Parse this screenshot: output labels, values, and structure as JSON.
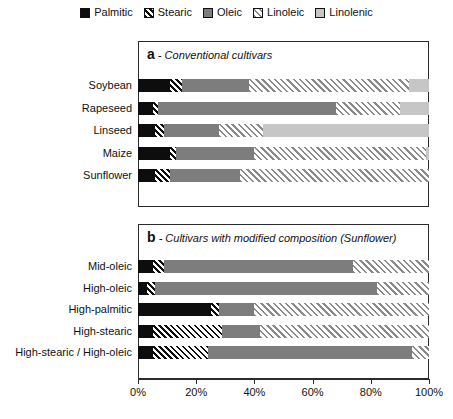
{
  "legend": {
    "position": "top-center",
    "items": [
      {
        "label": "Palmitic",
        "key": "palmitic",
        "fill": "#0d0d0d",
        "pattern": "solid-black"
      },
      {
        "label": "Stearic",
        "key": "stearic",
        "fill": "#ffffff",
        "pattern": "diagonal-hatch-dark"
      },
      {
        "label": "Oleic",
        "key": "oleic",
        "fill": "#7d7d7d",
        "pattern": "solid-gray"
      },
      {
        "label": "Linoleic",
        "key": "linoleic",
        "fill": "#ffffff",
        "pattern": "diagonal-hatch-gray"
      },
      {
        "label": "Linolenic",
        "key": "linolenic",
        "fill": "#c6c6c6",
        "pattern": "solid-light-gray"
      }
    ]
  },
  "chart_data": {
    "type": "bar",
    "orientation": "horizontal",
    "stacked": true,
    "title": "",
    "xlabel": "",
    "ylabel": "",
    "xlim": [
      0,
      100
    ],
    "xticks": [
      "0%",
      "20%",
      "40%",
      "60%",
      "80%",
      "100%"
    ],
    "xtick_values": [
      0,
      20,
      40,
      60,
      80,
      100
    ],
    "grid": false,
    "legend_entries": [
      "Palmitic",
      "Stearic",
      "Oleic",
      "Linoleic",
      "Linolenic"
    ],
    "panels": [
      {
        "id": "a",
        "marker": "a",
        "title": "- Conventional cultivars",
        "categories": [
          "Soybean",
          "Rapeseed",
          "Linseed",
          "Maize",
          "Sunflower"
        ],
        "series": [
          {
            "name": "Palmitic",
            "values": [
              11,
              5,
              6,
              11,
              6
            ]
          },
          {
            "name": "Stearic",
            "values": [
              4,
              2,
              3,
              2,
              5
            ]
          },
          {
            "name": "Oleic",
            "values": [
              23,
              61,
              19,
              27,
              24
            ]
          },
          {
            "name": "Linoleic",
            "values": [
              55,
              22,
              15,
              59,
              65
            ]
          },
          {
            "name": "Linolenic",
            "values": [
              7,
              10,
              57,
              1,
              0
            ]
          }
        ]
      },
      {
        "id": "b",
        "marker": "b",
        "title": "- Cultivars with modified composition (Sunflower)",
        "categories": [
          "Mid-oleic",
          "High-oleic",
          "High-palmitic",
          "High-stearic",
          "High-stearic / High-oleic"
        ],
        "series": [
          {
            "name": "Palmitic",
            "values": [
              5,
              3,
              25,
              5,
              5
            ]
          },
          {
            "name": "Stearic",
            "values": [
              4,
              3,
              3,
              24,
              19
            ]
          },
          {
            "name": "Oleic",
            "values": [
              65,
              76,
              12,
              13,
              70
            ]
          },
          {
            "name": "Linoleic",
            "values": [
              26,
              18,
              60,
              58,
              6
            ]
          },
          {
            "name": "Linolenic",
            "values": [
              0,
              0,
              0,
              0,
              0
            ]
          }
        ]
      }
    ]
  }
}
